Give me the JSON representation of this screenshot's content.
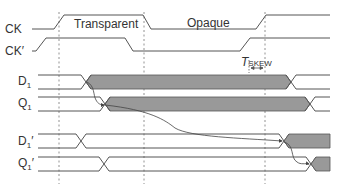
{
  "diagram": {
    "signals": [
      {
        "name": "CK",
        "main": "CK",
        "sub": "",
        "prime": ""
      },
      {
        "name": "CK'",
        "main": "CK",
        "sub": "",
        "prime": "′"
      },
      {
        "name": "D1",
        "main": "D",
        "sub": "1",
        "prime": ""
      },
      {
        "name": "Q1",
        "main": "Q",
        "sub": "1",
        "prime": ""
      },
      {
        "name": "D1'",
        "main": "D",
        "sub": "1",
        "prime": "′"
      },
      {
        "name": "Q1'",
        "main": "Q",
        "sub": "1",
        "prime": "′"
      }
    ],
    "phases": {
      "transparent": "Transparent",
      "opaque": "Opaque"
    },
    "skew": {
      "symbol": "T",
      "subscript": "SKEW"
    },
    "colors": {
      "line": "#555555",
      "shade": "#999999",
      "shade_stroke": "#555555",
      "dash": "#777777"
    }
  }
}
